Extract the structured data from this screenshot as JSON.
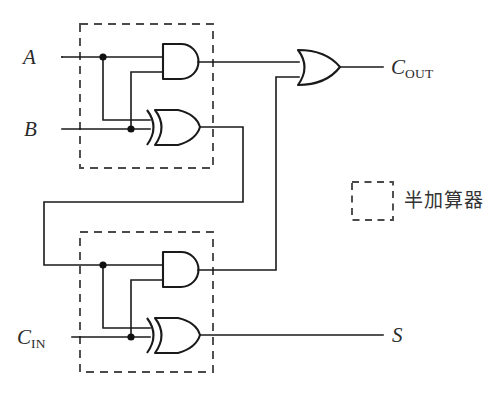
{
  "diagram": {
    "background_color": "#ffffff",
    "wire_color": "#1a1a1a",
    "dash_color": "#4a4a4a"
  },
  "labels": {
    "input_a": "A",
    "input_b": "B",
    "input_cin_base": "C",
    "input_cin_sub": "IN",
    "output_cout_base": "C",
    "output_cout_sub": "OUT",
    "output_s": "S"
  },
  "legend": {
    "text": "半加算器"
  },
  "gates": [
    {
      "id": "and-top",
      "type": "AND",
      "label": "AND"
    },
    {
      "id": "xor-top",
      "type": "XOR",
      "label": "XOR"
    },
    {
      "id": "and-bottom",
      "type": "AND",
      "label": "AND"
    },
    {
      "id": "xor-bottom",
      "type": "XOR",
      "label": "XOR"
    },
    {
      "id": "or-carry",
      "type": "OR",
      "label": "OR"
    }
  ],
  "blocks": [
    {
      "id": "half-adder-1",
      "label": "半加算器"
    },
    {
      "id": "half-adder-2",
      "label": "半加算器"
    }
  ]
}
